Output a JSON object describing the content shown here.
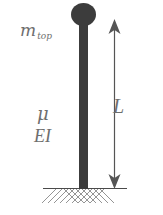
{
  "diagram": {
    "type": "cantilever-beam-with-tip-mass",
    "labels": {
      "tip_mass": {
        "main": "m",
        "subscript": "top"
      },
      "mass_per_length": "μ",
      "flexural_rigidity": "EI",
      "length": "L"
    },
    "colors": {
      "beam": "#3c3c3c",
      "label": "#6e6e6e",
      "ground": "#4a4a4a",
      "arrow": "#555555",
      "background": "#ffffff"
    }
  }
}
